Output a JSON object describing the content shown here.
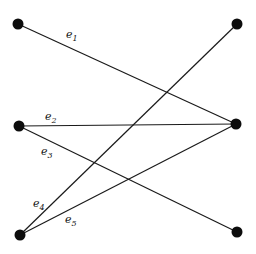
{
  "diagram": {
    "type": "bipartite-graph",
    "nodes": [
      {
        "id": "L1",
        "x": 18,
        "y": 24
      },
      {
        "id": "L2",
        "x": 19,
        "y": 126
      },
      {
        "id": "L3",
        "x": 20,
        "y": 235
      },
      {
        "id": "R1",
        "x": 237,
        "y": 24
      },
      {
        "id": "R2",
        "x": 236,
        "y": 124
      },
      {
        "id": "R3",
        "x": 237,
        "y": 232
      }
    ],
    "edges": [
      {
        "id": "e1",
        "base": "e",
        "sub": "1",
        "from": "L1",
        "to": "R2",
        "label_x": 66,
        "label_y": 38
      },
      {
        "id": "e2",
        "base": "e",
        "sub": "2",
        "from": "L2",
        "to": "R2",
        "label_x": 45,
        "label_y": 120
      },
      {
        "id": "e3",
        "base": "e",
        "sub": "3",
        "from": "L2",
        "to": "R3",
        "label_x": 41,
        "label_y": 155
      },
      {
        "id": "e4",
        "base": "e",
        "sub": "4",
        "from": "L3",
        "to": "R1",
        "label_x": 33,
        "label_y": 207
      },
      {
        "id": "e5",
        "base": "e",
        "sub": "5",
        "from": "L3",
        "to": "R2",
        "label_x": 65,
        "label_y": 223
      }
    ]
  }
}
